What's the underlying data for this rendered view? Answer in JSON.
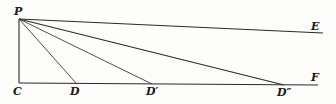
{
  "diagram": {
    "type": "geometric-construction",
    "stroke_color": "#2a2a2a",
    "background": "#fdfdfc",
    "points": {
      "P": {
        "label": "P",
        "x": 19,
        "y": 19,
        "label_x": 14,
        "label_y": 15
      },
      "C": {
        "label": "C",
        "x": 19,
        "y": 83,
        "label_x": 13,
        "label_y": 95
      },
      "D": {
        "label": "D",
        "x": 76,
        "y": 83,
        "label_x": 70,
        "label_y": 95
      },
      "D1": {
        "label": "D′",
        "x": 152,
        "y": 84,
        "label_x": 146,
        "label_y": 95
      },
      "D2": {
        "label": "D″",
        "x": 284,
        "y": 85,
        "label_x": 277,
        "label_y": 96
      },
      "E": {
        "label": "E",
        "x": 323,
        "y": 33,
        "label_x": 311,
        "label_y": 30
      },
      "F": {
        "label": "F",
        "x": 318,
        "y": 85,
        "label_x": 311,
        "label_y": 81
      }
    },
    "segments": [
      {
        "name": "PC",
        "from": "P",
        "to": "C"
      },
      {
        "name": "CF",
        "from": "C",
        "to": "F"
      },
      {
        "name": "PE",
        "from": "P",
        "to": "E"
      },
      {
        "name": "PD",
        "from": "P",
        "to": "D"
      },
      {
        "name": "PD1",
        "from": "P",
        "to": "D1"
      },
      {
        "name": "PD2",
        "from": "P",
        "to": "D2"
      }
    ]
  }
}
